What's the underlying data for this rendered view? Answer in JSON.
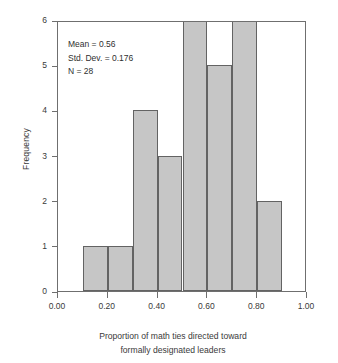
{
  "chart_data": {
    "type": "bar",
    "title": "",
    "xlabel": "Proportion of math ties directed toward formally designated leaders",
    "xlabel_lines": [
      "Proportion of math ties directed toward",
      "formally designated leaders"
    ],
    "ylabel": "Frequency",
    "categories": [
      "0.10-0.20",
      "0.20-0.30",
      "0.30-0.40",
      "0.40-0.50",
      "0.50-0.60",
      "0.60-0.70",
      "0.70-0.80",
      "0.80-0.90"
    ],
    "bin_starts": [
      0.1,
      0.2,
      0.3,
      0.4,
      0.5,
      0.6,
      0.7,
      0.8
    ],
    "bin_width": 0.1,
    "values": [
      1,
      1,
      4,
      3,
      6,
      5,
      6,
      2
    ],
    "xlim": [
      0.0,
      1.0
    ],
    "ylim": [
      0,
      6
    ],
    "xticks": [
      0.0,
      0.2,
      0.4,
      0.6,
      0.8,
      1.0
    ],
    "xtick_labels": [
      "0.00",
      "0.20",
      "0.40",
      "0.60",
      "0.80",
      "1.00"
    ],
    "yticks": [
      0,
      1,
      2,
      3,
      4,
      5,
      6
    ],
    "ytick_labels": [
      "0",
      "1",
      "2",
      "3",
      "4",
      "5",
      "6"
    ],
    "grid": false,
    "legend": false,
    "bar_color": "#c6c6c6",
    "bar_edge_color": "#636363",
    "frame_color": "#6f6f6f",
    "background": "#ffffff",
    "annotations": {
      "mean": "Mean = 0.56",
      "std_dev": "Std. Dev. = 0.176",
      "n": "N = 28"
    }
  }
}
